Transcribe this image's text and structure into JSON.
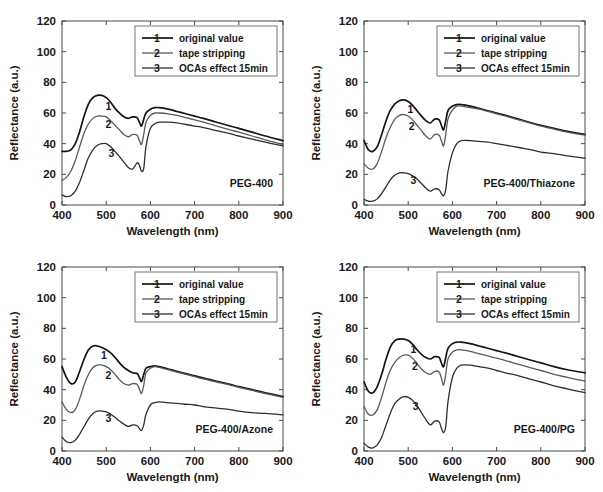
{
  "figure": {
    "panel_count": 4,
    "axis": {
      "xlabel": "Wavelength (nm)",
      "ylabel": "Reflectance (a.u.)",
      "xticks": [
        "400",
        "500",
        "600",
        "700",
        "800",
        "900"
      ],
      "yticks": [
        "0",
        "20",
        "40",
        "60",
        "80",
        "100",
        "120"
      ],
      "xlim": [
        400,
        900
      ],
      "ylim": [
        0,
        120
      ]
    },
    "legend": {
      "position": "top-right",
      "entries": [
        {
          "marker": "1",
          "label": "original value",
          "color": "#1a1a1a"
        },
        {
          "marker": "2",
          "label": "tape stripping",
          "color": "#555555"
        },
        {
          "marker": "3",
          "label": "OCAs effect 15min",
          "color": "#333333"
        }
      ]
    }
  },
  "chart_data": [
    {
      "type": "line",
      "title": "PEG-400",
      "panel": "top-left",
      "xlabel": "Wavelength (nm)",
      "ylabel": "Reflectance (a.u.)",
      "xlim": [
        400,
        900
      ],
      "ylim": [
        0,
        120
      ],
      "grid": false,
      "x": [
        400,
        410,
        420,
        430,
        440,
        450,
        460,
        470,
        480,
        490,
        500,
        510,
        520,
        530,
        540,
        550,
        560,
        570,
        575,
        580,
        585,
        590,
        600,
        610,
        620,
        640,
        660,
        680,
        700,
        720,
        750,
        780,
        800,
        830,
        860,
        900
      ],
      "series": [
        {
          "name": "original value",
          "marker": "1",
          "values": [
            35,
            35,
            36,
            40,
            48,
            58,
            66,
            70,
            71.5,
            71.5,
            70,
            67,
            63,
            60,
            57.5,
            56.5,
            57.5,
            57,
            54,
            51.5,
            56,
            60,
            62.5,
            63.5,
            63.5,
            62.5,
            61,
            59.5,
            58,
            56.5,
            54,
            51.5,
            50,
            47.5,
            45,
            42
          ]
        },
        {
          "name": "tape stripping",
          "marker": "2",
          "values": [
            16,
            18,
            22,
            29,
            38,
            47,
            53,
            56.5,
            58,
            58,
            57.5,
            55,
            52,
            49,
            46,
            44.5,
            46,
            45.5,
            42,
            39.5,
            46,
            54,
            58.5,
            60,
            60,
            59.5,
            58.5,
            57,
            55.5,
            54,
            51.5,
            49,
            47.5,
            45,
            42.5,
            39.5
          ]
        },
        {
          "name": "OCAs effect 15min",
          "marker": "3",
          "values": [
            6.5,
            5.5,
            6,
            9,
            15,
            23,
            31,
            36,
            39,
            40,
            40,
            38,
            35,
            31.5,
            28,
            24.5,
            23.5,
            27.5,
            26,
            22,
            24,
            38,
            50,
            53,
            54,
            54,
            53.5,
            52.5,
            51.5,
            50.5,
            48.5,
            46.5,
            45,
            43,
            41,
            38.5
          ]
        }
      ]
    },
    {
      "type": "line",
      "title": "PEG-400/Thiazone",
      "panel": "top-right",
      "xlabel": "Wavelength (nm)",
      "ylabel": "Reflectance (a.u.)",
      "xlim": [
        400,
        900
      ],
      "ylim": [
        0,
        120
      ],
      "grid": false,
      "x": [
        400,
        410,
        420,
        430,
        440,
        450,
        460,
        470,
        480,
        490,
        500,
        510,
        520,
        530,
        540,
        550,
        560,
        570,
        575,
        580,
        585,
        590,
        600,
        610,
        620,
        640,
        660,
        680,
        700,
        720,
        750,
        780,
        800,
        830,
        860,
        900
      ],
      "series": [
        {
          "name": "original value",
          "marker": "1",
          "values": [
            42,
            36,
            35,
            38,
            46,
            55,
            62,
            66,
            68,
            68.5,
            67.5,
            65,
            61.5,
            58,
            55,
            53.5,
            56,
            55.5,
            52,
            49,
            55,
            61.5,
            64.5,
            65.5,
            65.5,
            64.5,
            63,
            61.5,
            60,
            58.5,
            56,
            53.5,
            52,
            50,
            48,
            46
          ]
        },
        {
          "name": "tape stripping",
          "marker": "2",
          "values": [
            27,
            24,
            23.5,
            27,
            35,
            44,
            51,
            56,
            58.5,
            59,
            58,
            55.5,
            52,
            48.5,
            45,
            43,
            46,
            45.5,
            42,
            38.5,
            46,
            56,
            62,
            64.5,
            64.5,
            63.5,
            62.5,
            61,
            59.5,
            58,
            55.5,
            53,
            51.5,
            49.5,
            47.5,
            45.5
          ]
        },
        {
          "name": "OCAs effect 15min",
          "marker": "3",
          "values": [
            3.5,
            2.5,
            2.5,
            4,
            7.5,
            12,
            16.5,
            19.5,
            21,
            21,
            20.5,
            19,
            17,
            14,
            11,
            9,
            10.5,
            10,
            7.5,
            6,
            10,
            22,
            34,
            40,
            42,
            42,
            41.5,
            41,
            40,
            39,
            37.5,
            36,
            34.5,
            33.5,
            32,
            30.5
          ]
        }
      ]
    },
    {
      "type": "line",
      "title": "PEG-400/Azone",
      "panel": "bottom-left",
      "xlabel": "Wavelength (nm)",
      "ylabel": "Reflectance (a.u.)",
      "xlim": [
        400,
        900
      ],
      "ylim": [
        0,
        120
      ],
      "grid": false,
      "x": [
        400,
        410,
        420,
        430,
        440,
        450,
        460,
        470,
        480,
        490,
        500,
        510,
        520,
        530,
        540,
        550,
        560,
        570,
        575,
        580,
        585,
        590,
        600,
        610,
        620,
        640,
        660,
        680,
        700,
        720,
        750,
        780,
        800,
        830,
        860,
        900
      ],
      "series": [
        {
          "name": "original value",
          "marker": "1",
          "values": [
            55,
            48,
            44,
            45,
            52,
            60,
            66,
            68.5,
            68.5,
            67.5,
            66,
            64,
            61,
            57.5,
            54.5,
            52.5,
            51,
            50.5,
            48,
            45.5,
            50,
            54,
            55,
            55.5,
            55,
            53.5,
            52,
            50.5,
            49,
            47.5,
            45.5,
            43.5,
            42,
            40,
            38,
            35.5
          ]
        },
        {
          "name": "tape stripping",
          "marker": "2",
          "values": [
            32,
            27,
            25,
            27,
            34,
            43,
            50,
            54.5,
            56,
            56,
            55,
            53,
            50,
            46.5,
            44,
            43,
            44,
            43.5,
            40.5,
            37.5,
            43,
            51,
            54,
            55,
            54.5,
            53,
            51.5,
            50,
            48.5,
            47,
            45,
            43,
            41.5,
            39.5,
            37.5,
            35
          ]
        },
        {
          "name": "OCAs effect 15min",
          "marker": "3",
          "values": [
            9,
            6,
            5.5,
            7,
            11,
            16,
            21,
            24.5,
            26,
            26,
            25.5,
            24,
            22,
            19.5,
            17.5,
            16,
            17,
            16.5,
            14.5,
            13.5,
            17,
            24,
            30,
            31.5,
            32,
            31.5,
            31,
            30.5,
            30,
            29,
            28,
            27,
            26,
            25,
            24.5,
            23.5
          ]
        }
      ]
    },
    {
      "type": "line",
      "title": "PEG-400/PG",
      "panel": "bottom-right",
      "xlabel": "Wavelength (nm)",
      "ylabel": "Reflectance (a.u.)",
      "xlim": [
        400,
        900
      ],
      "ylim": [
        0,
        120
      ],
      "grid": false,
      "x": [
        400,
        410,
        420,
        430,
        440,
        450,
        460,
        470,
        480,
        490,
        500,
        510,
        520,
        530,
        540,
        550,
        560,
        570,
        575,
        580,
        585,
        590,
        600,
        610,
        620,
        640,
        660,
        680,
        700,
        720,
        750,
        780,
        800,
        830,
        860,
        900
      ],
      "series": [
        {
          "name": "original value",
          "marker": "1",
          "values": [
            45,
            39,
            38,
            42,
            50,
            60,
            68,
            72,
            73,
            73,
            72,
            69.5,
            66,
            63,
            61,
            60,
            61.5,
            61,
            57.5,
            55,
            61,
            67,
            70,
            71,
            71,
            70,
            68.5,
            67,
            65.5,
            64,
            61.5,
            59,
            57.5,
            55,
            53,
            51
          ]
        },
        {
          "name": "tape stripping",
          "marker": "2",
          "values": [
            29,
            24,
            23.5,
            27,
            35,
            45,
            53,
            58,
            61,
            62.5,
            62.5,
            60.5,
            57,
            53.5,
            51,
            50,
            52,
            51.5,
            47.5,
            43,
            50,
            60,
            64.5,
            66,
            66,
            65,
            63.5,
            62,
            60.5,
            59,
            56.5,
            54,
            52.5,
            50,
            48,
            45.5
          ]
        },
        {
          "name": "OCAs effect 15min",
          "marker": "3",
          "values": [
            5,
            2.5,
            2,
            4,
            9,
            17,
            25,
            31,
            34,
            35.5,
            35,
            33,
            29.5,
            25,
            20.5,
            17,
            19.5,
            19,
            15,
            12,
            16,
            32,
            48,
            54,
            56,
            56,
            55,
            54,
            52.5,
            51,
            49,
            46.5,
            45,
            42.5,
            40.5,
            38
          ]
        }
      ]
    }
  ]
}
